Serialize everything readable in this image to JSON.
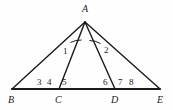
{
  "figure": {
    "background_color": "#fefefe",
    "stroke_color": "#1a1a1a"
  },
  "vertices": [
    {
      "name": "A",
      "label": "A",
      "x": 85,
      "y": 22,
      "label_x": 82,
      "label_y": 4
    },
    {
      "name": "B",
      "label": "B",
      "x": 12,
      "y": 89,
      "label_x": 8,
      "label_y": 95
    },
    {
      "name": "C",
      "label": "C",
      "x": 59,
      "y": 89,
      "label_x": 55,
      "label_y": 95
    },
    {
      "name": "D",
      "label": "D",
      "x": 115,
      "y": 89,
      "label_x": 111,
      "label_y": 95
    },
    {
      "name": "E",
      "label": "E",
      "x": 160,
      "y": 89,
      "label_x": 157,
      "label_y": 95
    }
  ],
  "segments": [
    {
      "name": "segment-AB",
      "from": "A",
      "to": "B",
      "width": 1.4
    },
    {
      "name": "segment-AC",
      "from": "A",
      "to": "C",
      "width": 1.4
    },
    {
      "name": "segment-AD",
      "from": "A",
      "to": "D",
      "width": 1.4
    },
    {
      "name": "segment-AE",
      "from": "A",
      "to": "E",
      "width": 1.4
    },
    {
      "name": "segment-BE",
      "from": "B",
      "to": "E",
      "width": 2.0
    }
  ],
  "angle_arcs": [
    {
      "name": "angle-1-arc",
      "at": "A",
      "between": [
        "AB",
        "AC"
      ],
      "path": "M 70.5 42.5 A 22 22 0 0 1 81.5 40.0"
    },
    {
      "name": "angle-2-arc",
      "at": "A",
      "between": [
        "AD",
        "AE"
      ],
      "path": "M 89.5 40.5 A 22 22 0 0 1 100.5 43.5"
    }
  ],
  "angle_labels": [
    {
      "name": "angle-label-1",
      "text": "1",
      "x": 63,
      "y": 47
    },
    {
      "name": "angle-label-2",
      "text": "2",
      "x": 104,
      "y": 46
    }
  ],
  "base_labels": [
    {
      "name": "base-label-3",
      "text": "3",
      "x": 37,
      "y": 78
    },
    {
      "name": "base-label-4",
      "text": "4",
      "x": 47,
      "y": 78
    },
    {
      "name": "base-label-5",
      "text": "5",
      "x": 62,
      "y": 78
    },
    {
      "name": "base-label-6",
      "text": "6",
      "x": 103,
      "y": 78
    },
    {
      "name": "base-label-7",
      "text": "7",
      "x": 118,
      "y": 78
    },
    {
      "name": "base-label-8",
      "text": "8",
      "x": 129,
      "y": 78
    }
  ]
}
